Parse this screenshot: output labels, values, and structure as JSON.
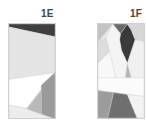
{
  "panels": [
    {
      "id": "1E",
      "label": "1E",
      "shapes": [
        {
          "fill": "#e8e8e8",
          "points": "0,0 47,0 47,95 0,95"
        },
        {
          "fill": "#3f3f3f",
          "points": "0,0 47,0 47,13 0,3"
        },
        {
          "fill": "#e4e4e4",
          "points": "0,3 47,13 47,49 0,56"
        },
        {
          "fill": "#ffffff",
          "points": "0,56 47,49 18,85 0,82"
        },
        {
          "fill": "#b9b9b9",
          "points": "47,49 33,62 33,92 18,86"
        },
        {
          "fill": "#9a9a9a",
          "points": "33,62 47,49 47,96 33,92"
        },
        {
          "fill": "#ececec",
          "points": "0,82 18,86 47,96 0,96"
        }
      ]
    },
    {
      "id": "1F",
      "label": "1F",
      "shapes": [
        {
          "fill": "#e8e8e8",
          "points": "0,0 47,0 47,96 0,96"
        },
        {
          "fill": "#c2c2c2",
          "points": "0,0 15,0 0,18"
        },
        {
          "fill": "#6a6a6a",
          "points": "15,0 30,0 23,10"
        },
        {
          "fill": "#3a3a3a",
          "points": "23,10 30,0 34,6 38,16 30,40 24,27 22,16"
        },
        {
          "fill": "#d7d7d7",
          "points": "30,0 47,0 47,18 38,16 34,6"
        },
        {
          "fill": "#f4f4f4",
          "points": "15,0 23,10 22,16 24,27 30,40 28,55 18,55 8,14"
        },
        {
          "fill": "#dcdcdc",
          "points": "0,18 8,14 12,28 0,40"
        },
        {
          "fill": "#f8f8f8",
          "points": "0,40 12,28 18,55 0,55"
        },
        {
          "fill": "#b5b5b5",
          "points": "28,55 30,40 34,55"
        },
        {
          "fill": "#f0f0f0",
          "points": "38,16 47,18 47,55 34,55 30,40"
        },
        {
          "fill": "#fbfbfb",
          "points": "0,55 47,55 47,74 0,68"
        },
        {
          "fill": "#9c9c9c",
          "points": "0,68 16,70 10,96 0,96"
        },
        {
          "fill": "#6f6f6f",
          "points": "16,70 30,72 40,96 10,96"
        },
        {
          "fill": "#f2f2f2",
          "points": "30,72 47,74 47,96 40,96"
        }
      ]
    }
  ]
}
